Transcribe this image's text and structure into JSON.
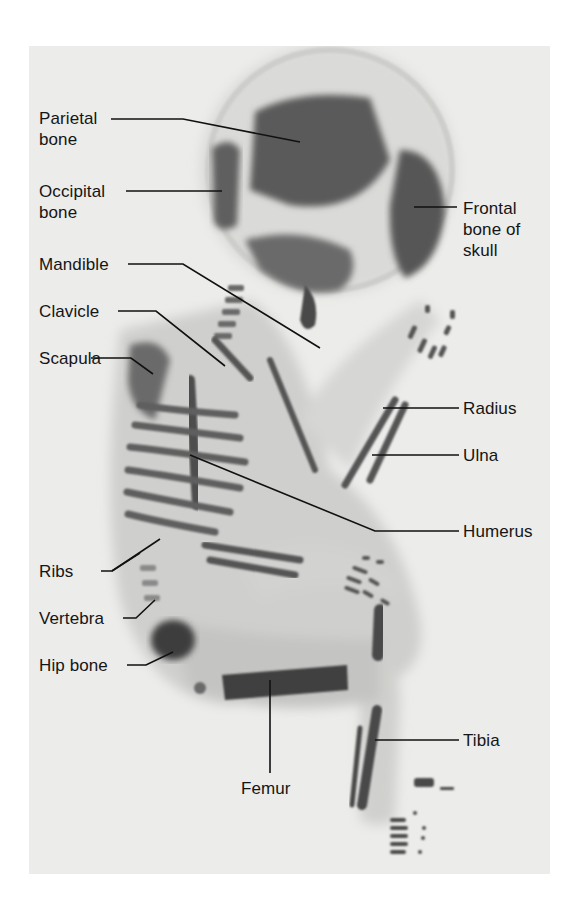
{
  "figure": {
    "background_color": "#ececea",
    "bone_color": "#4a4a4a",
    "soft_tissue_color": "#c9c9c7"
  },
  "labels": {
    "parietal": "Parietal\nbone",
    "occipital": "Occipital\nbone",
    "mandible": "Mandible",
    "clavicle": "Clavicle",
    "scapula": "Scapula",
    "ribs": "Ribs",
    "vertebra": "Vertebra",
    "hip": "Hip bone",
    "femur": "Femur",
    "frontal": "Frontal\nbone of\nskull",
    "radius": "Radius",
    "ulna": "Ulna",
    "humerus": "Humerus",
    "tibia": "Tibia"
  }
}
